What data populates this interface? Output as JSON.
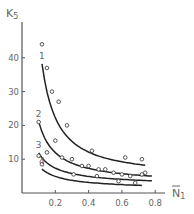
{
  "chart_data": {
    "type": "line",
    "title": "",
    "xlabel": "N̄1",
    "ylabel": "K5",
    "xlim": [
      0,
      0.85
    ],
    "ylim": [
      0,
      48
    ],
    "x_ticks": [
      "0.2",
      "0.4",
      "0.6",
      "0.8"
    ],
    "y_ticks": [
      "10",
      "20",
      "30",
      "40"
    ],
    "grid": false,
    "legend": "curve labels 1-4 placed at curve starts",
    "series": [
      {
        "name": "1",
        "points": [
          [
            0.12,
            44
          ],
          [
            0.15,
            37
          ],
          [
            0.18,
            30
          ],
          [
            0.22,
            27
          ],
          [
            0.27,
            20
          ],
          [
            0.42,
            12.5
          ],
          [
            0.62,
            10.5
          ],
          [
            0.72,
            10
          ]
        ]
      },
      {
        "name": "2",
        "points": [
          [
            0.1,
            21
          ],
          [
            0.2,
            15.5
          ],
          [
            0.36,
            8
          ],
          [
            0.46,
            7
          ],
          [
            0.55,
            6
          ],
          [
            0.65,
            5
          ],
          [
            0.72,
            5.5
          ]
        ]
      },
      {
        "name": "3",
        "points": [
          [
            0.1,
            11
          ],
          [
            0.15,
            12
          ],
          [
            0.24,
            10.5
          ],
          [
            0.3,
            10
          ],
          [
            0.4,
            8
          ],
          [
            0.5,
            7
          ],
          [
            0.6,
            5.5
          ],
          [
            0.74,
            6
          ]
        ]
      },
      {
        "name": "4",
        "points": [
          [
            0.12,
            8.5
          ],
          [
            0.31,
            5.5
          ],
          [
            0.45,
            5
          ],
          [
            0.58,
            3.5
          ],
          [
            0.68,
            3
          ]
        ]
      }
    ]
  }
}
